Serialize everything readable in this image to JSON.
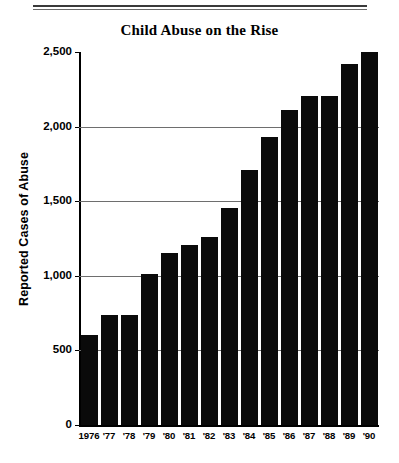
{
  "figure": {
    "title": "Child Abuse on the Rise",
    "top_rule": "double-rule"
  },
  "chart_data": {
    "type": "bar",
    "title": "Child Abuse on the Rise",
    "xlabel": "",
    "ylabel": "Reported Cases of Abuse",
    "categories": [
      "1976",
      "'77",
      "'78",
      "'79",
      "'80",
      "'81",
      "'82",
      "'83",
      "'84",
      "'85",
      "'86",
      "'87",
      "'88",
      "'89",
      "'90"
    ],
    "values": [
      600,
      740,
      740,
      1010,
      1150,
      1205,
      1260,
      1455,
      1710,
      1930,
      2110,
      2205,
      2205,
      2420,
      2500
    ],
    "ylim": [
      0,
      2500
    ],
    "ytick_values": [
      0,
      500,
      1000,
      1500,
      2000,
      2500
    ],
    "ytick_labels": [
      "0",
      "500",
      "1,000",
      "1,500",
      "2,000",
      "2,500"
    ],
    "grid": "horizontal-gridlines-at-500-1000-1500-2000",
    "legend": "none",
    "bar_color": "#0a0a0a",
    "background_color": "#ffffff",
    "note": "Values in units of reported cases of abuse (unlabeled on bars; read from gridlines)."
  },
  "axes": {
    "ytitle": "Reported Cases of Abuse",
    "yticks": [
      {
        "label": "2,500",
        "value": 2500
      },
      {
        "label": "2,000",
        "value": 2000
      },
      {
        "label": "1,500",
        "value": 1500
      },
      {
        "label": "1,000",
        "value": 1000
      },
      {
        "label": "500",
        "value": 500
      },
      {
        "label": "0",
        "value": 0
      }
    ]
  }
}
